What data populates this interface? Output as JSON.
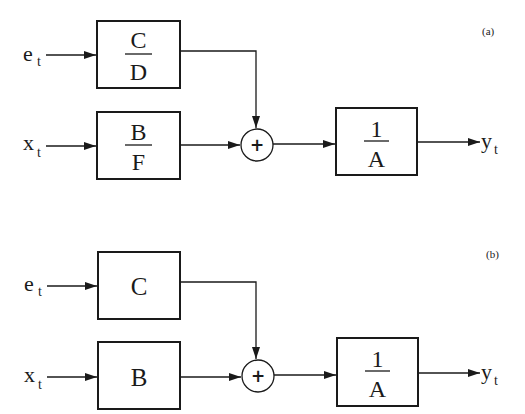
{
  "diagrams": [
    {
      "panel_label": "(a)",
      "inputs": [
        {
          "base": "e",
          "sub": "t"
        },
        {
          "base": "x",
          "sub": "t"
        }
      ],
      "blocks": {
        "noise_filter": {
          "numerator": "C",
          "denominator": "D"
        },
        "input_filter": {
          "numerator": "B",
          "denominator": "F"
        },
        "output_filter": {
          "numerator": "1",
          "denominator": "A"
        }
      },
      "summing_junction": "+",
      "output": {
        "base": "y",
        "sub": "t"
      }
    },
    {
      "panel_label": "(b)",
      "inputs": [
        {
          "base": "e",
          "sub": "t"
        },
        {
          "base": "x",
          "sub": "t"
        }
      ],
      "blocks": {
        "noise_filter": {
          "label": "C"
        },
        "input_filter": {
          "label": "B"
        },
        "output_filter": {
          "numerator": "1",
          "denominator": "A"
        }
      },
      "summing_junction": "+",
      "output": {
        "base": "y",
        "sub": "t"
      }
    }
  ]
}
